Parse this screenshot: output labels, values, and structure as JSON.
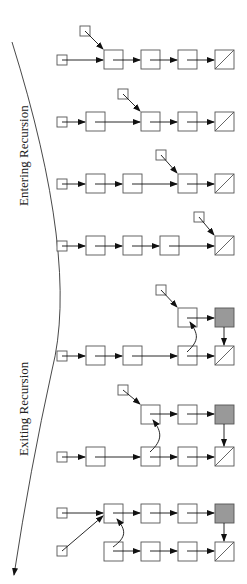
{
  "labels": {
    "entering": "Entering Recursion",
    "exiting": "Exiting Recursion"
  },
  "colors": {
    "stroke": "#555555",
    "shaded_node": "#999999",
    "background": "#ffffff"
  },
  "rows": [
    {
      "stage": 1,
      "phase": "entering",
      "pointer_target_column": 0
    },
    {
      "stage": 2,
      "phase": "entering",
      "pointer_target_column": 1
    },
    {
      "stage": 3,
      "phase": "entering",
      "pointer_target_column": 2
    },
    {
      "stage": 4,
      "phase": "entering",
      "pointer_target_column": 3
    },
    {
      "stage": 5,
      "phase": "exiting",
      "reversed_from_column": 2
    },
    {
      "stage": 6,
      "phase": "exiting",
      "reversed_from_column": 1
    },
    {
      "stage": 7,
      "phase": "exiting",
      "reversed_from_column": 0
    }
  ]
}
